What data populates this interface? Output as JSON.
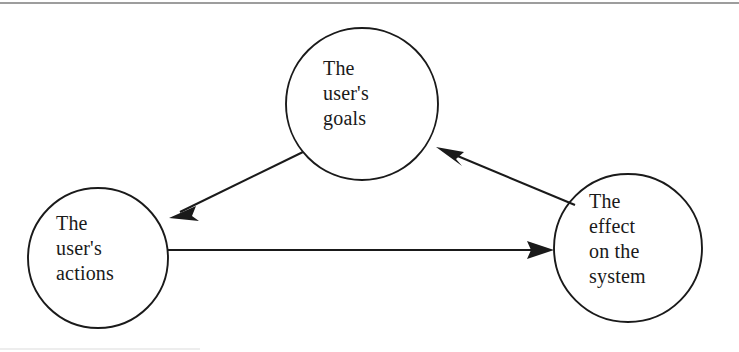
{
  "figure": {
    "name": "gulf-of-execution-evaluation-cycle",
    "background_color": "#ffffff",
    "stroke_color": "#1a1a1a",
    "text_color": "#1a1a1a",
    "top_rule": {
      "name": "top-horizontal-rule",
      "color": "#8d8d8d"
    },
    "bottom_rule": {
      "name": "bottom-horizontal-rule",
      "color": "#d8d8d8"
    }
  },
  "nodes": [
    {
      "id": "goals",
      "label": "The\nuser's\ngoals",
      "cx": 362,
      "cy": 104,
      "r": 76
    },
    {
      "id": "actions",
      "label": "The\nuser's\nactions",
      "cx": 98,
      "cy": 258,
      "r": 70
    },
    {
      "id": "effect",
      "label": "The\neffect\non the\nsystem",
      "cx": 628,
      "cy": 248,
      "r": 74
    }
  ],
  "edges": [
    {
      "id": "goals-to-actions",
      "from": "goals",
      "to": "actions",
      "direction": "down-left",
      "arrowhead": "at-target"
    },
    {
      "id": "actions-to-effect",
      "from": "actions",
      "to": "effect",
      "direction": "right",
      "arrowhead": "at-target"
    },
    {
      "id": "effect-to-goals",
      "from": "effect",
      "to": "goals",
      "direction": "up-left",
      "arrowhead": "at-target"
    }
  ]
}
